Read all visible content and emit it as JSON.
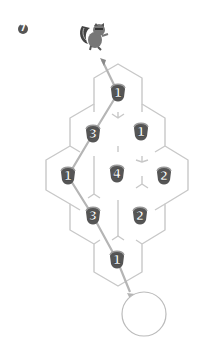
{
  "puzzle": {
    "number": "7",
    "start_character": "squirrel",
    "end_target": "empty-circle",
    "colors": {
      "wall": "#c8c8c8",
      "path": "#b5b5b5",
      "nut": "#555555",
      "badge": "#555555"
    },
    "cells": [
      {
        "id": "r0c0",
        "value": "1",
        "cx": 118,
        "cy": 93
      },
      {
        "id": "r1c0",
        "value": "3",
        "cx": 93,
        "cy": 134
      },
      {
        "id": "r1c1",
        "value": "1",
        "cx": 141,
        "cy": 132
      },
      {
        "id": "r2c0",
        "value": "1",
        "cx": 68,
        "cy": 176
      },
      {
        "id": "r2c1",
        "value": "4",
        "cx": 117,
        "cy": 174
      },
      {
        "id": "r2c2",
        "value": "2",
        "cx": 164,
        "cy": 176
      },
      {
        "id": "r3c0",
        "value": "3",
        "cx": 93,
        "cy": 216
      },
      {
        "id": "r3c1",
        "value": "2",
        "cx": 140,
        "cy": 216
      },
      {
        "id": "r4c0",
        "value": "1",
        "cx": 117,
        "cy": 260
      }
    ],
    "path": [
      [
        102,
        60
      ],
      [
        118,
        93
      ],
      [
        93,
        134
      ],
      [
        68,
        176
      ],
      [
        93,
        216
      ],
      [
        117,
        260
      ],
      [
        130,
        292
      ]
    ]
  }
}
